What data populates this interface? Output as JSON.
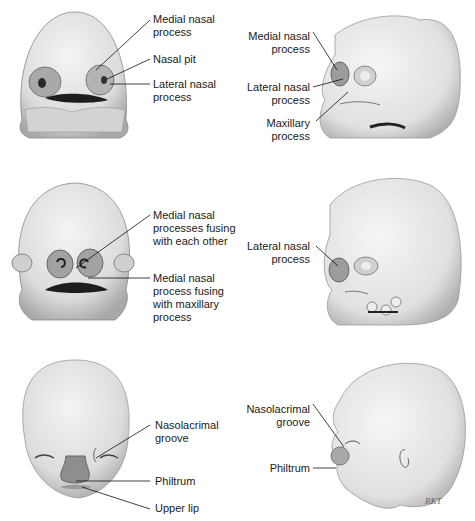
{
  "figure": {
    "panels": [
      {
        "id": "stage1-frontal",
        "view": "frontal",
        "labels": [
          "Medial nasal\nprocess",
          "Nasal pit",
          "Lateral nasal\nprocess"
        ]
      },
      {
        "id": "stage1-lateral",
        "view": "lateral",
        "labels": [
          "Medial nasal\nprocess",
          "Lateral nasal\nprocess",
          "Maxillary\nprocess"
        ]
      },
      {
        "id": "stage2-frontal",
        "view": "frontal",
        "labels": [
          "Medial nasal\nprocesses fusing\nwith each other",
          "Medial nasal\nprocess fusing\nwith maxillary\nprocess"
        ]
      },
      {
        "id": "stage2-lateral",
        "view": "lateral",
        "labels": [
          "Lateral nasal\nprocess"
        ]
      },
      {
        "id": "stage3-frontal",
        "view": "frontal",
        "labels": [
          "Nasolacrimal\ngroove",
          "Philtrum",
          "Upper lip"
        ]
      },
      {
        "id": "stage3-lateral",
        "view": "lateral",
        "labels": [
          "Nasolacrimal\ngroove",
          "Philtrum"
        ]
      }
    ],
    "signature": "RKT"
  }
}
